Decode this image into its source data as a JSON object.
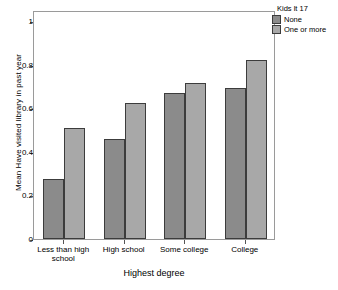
{
  "chart_data": {
    "type": "bar",
    "title": "",
    "subtitle": "",
    "xlabel": "Highest degree",
    "ylabel": "Mean Have visited library in past year",
    "categories": [
      "Less than high school",
      "High school",
      "Some college",
      "College"
    ],
    "series": [
      {
        "name": "None",
        "color": "#8b8b8b",
        "values": [
          0.275,
          0.457,
          0.668,
          0.692
        ]
      },
      {
        "name": "One or more",
        "color": "#a8a8a8",
        "values": [
          0.508,
          0.625,
          0.716,
          0.822
        ]
      }
    ],
    "ylim": [
      0,
      1.05
    ],
    "yticks": [
      0,
      0.2,
      0.4,
      0.6,
      0.8,
      1
    ],
    "ytick_labels": [
      "0",
      "0.2",
      "0.4",
      "0.6",
      "0.8",
      "1"
    ],
    "grid": false,
    "legend_position": "right-top",
    "legend_title": "Kids lt 17"
  }
}
